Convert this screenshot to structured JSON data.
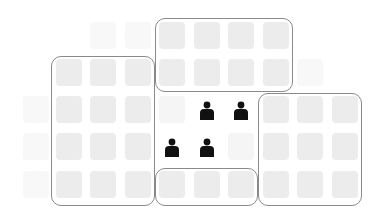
{
  "diagram": {
    "type": "seat-grid",
    "grid": {
      "columns": 10,
      "rows": 5,
      "col_x": [
        23,
        56,
        90,
        125,
        159,
        194,
        228,
        263,
        297,
        332
      ],
      "row_y": [
        22,
        59,
        96,
        133,
        171
      ]
    },
    "colors": {
      "cell": "#ececec",
      "cell_faint": "#f5f5f5",
      "group_border": "#8a8a8a",
      "person": "#111111",
      "background": "#ffffff"
    },
    "groups": [
      {
        "id": "group-left",
        "cols": [
          1,
          3
        ],
        "rows": [
          1,
          4
        ]
      },
      {
        "id": "group-top",
        "cols": [
          4,
          7
        ],
        "rows": [
          0,
          1
        ]
      },
      {
        "id": "group-right",
        "cols": [
          7,
          9
        ],
        "rows": [
          2,
          4
        ]
      },
      {
        "id": "group-bottom",
        "cols": [
          4,
          6
        ],
        "rows": [
          4,
          4
        ]
      }
    ],
    "people": [
      {
        "col": 5,
        "row": 2
      },
      {
        "col": 6,
        "row": 2
      },
      {
        "col": 4,
        "row": 3
      },
      {
        "col": 5,
        "row": 3
      }
    ],
    "people_count": 4
  }
}
